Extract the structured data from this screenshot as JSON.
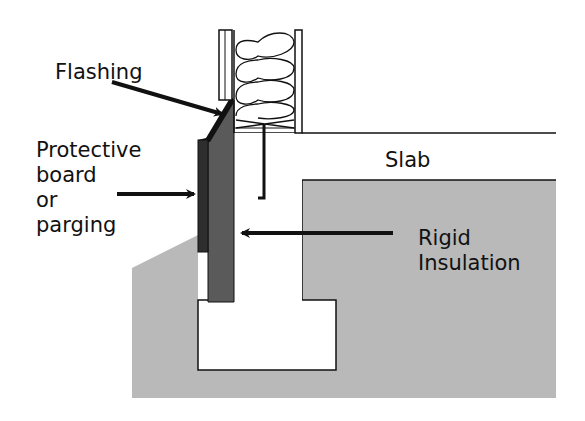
{
  "diagram": {
    "labels": {
      "flashing": "Flashing",
      "protective_board": [
        "Protective",
        "board",
        "or",
        "parging"
      ],
      "slab": "Slab",
      "rigid_insulation": [
        "Rigid",
        "Insulation"
      ]
    },
    "components": [
      "wood-frame-wall",
      "batt-insulation",
      "flashing",
      "protective-board",
      "rigid-insulation",
      "slab",
      "foundation-wall",
      "footing",
      "anchor-bolt",
      "soil"
    ],
    "colors": {
      "soil": "#b9b9b9",
      "rigid_insulation": "#5a5a5a",
      "protective_board": "#2e2e2e",
      "concrete": "#ffffff",
      "outline": "#111111"
    }
  }
}
